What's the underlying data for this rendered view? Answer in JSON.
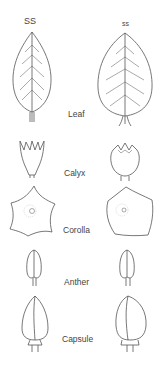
{
  "headers": {
    "left": "SS",
    "right": "ss"
  },
  "parts": [
    {
      "label": "Leaf"
    },
    {
      "label": "Calyx"
    },
    {
      "label": "Corolla"
    },
    {
      "label": "Anther"
    },
    {
      "label": "Capsule"
    }
  ],
  "colors": {
    "stroke": "#555555",
    "text": "#444444",
    "background": "#ffffff"
  }
}
